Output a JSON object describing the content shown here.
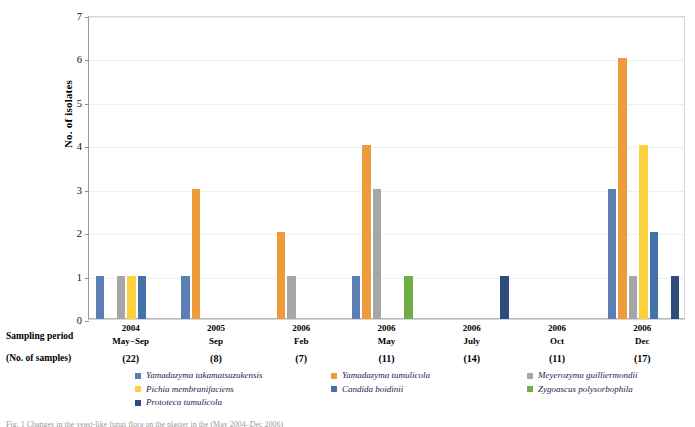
{
  "chart_data": {
    "type": "bar",
    "title": "",
    "xlabel": "Sampling period",
    "ylabel": "No. of isolates",
    "ylim": [
      0,
      7
    ],
    "yticks": [
      0,
      1,
      2,
      3,
      4,
      5,
      6,
      7
    ],
    "grid": true,
    "legend_position": "bottom",
    "categories": [
      "2004 May−Sep (22)",
      "2005 Sep (8)",
      "2006 Feb (7)",
      "2006 May (11)",
      "2006 July (14)",
      "2006 Oct (11)",
      "2006 Dec (17)"
    ],
    "series": [
      {
        "name": "Yamadazyma takamatsuzukensis",
        "color": "#5B7FB4",
        "values": [
          1,
          1,
          0,
          1,
          0,
          0,
          3
        ]
      },
      {
        "name": "Yamadazyma tumulicola",
        "color": "#ED9C3C",
        "values": [
          0,
          3,
          2,
          4,
          0,
          0,
          6
        ]
      },
      {
        "name": "Meyerozyma guilliermondii",
        "color": "#A6A6A6",
        "values": [
          1,
          0,
          1,
          3,
          0,
          0,
          1
        ]
      },
      {
        "name": "Pichia membranifaciens",
        "color": "#FCD13F",
        "values": [
          1,
          0,
          0,
          0,
          0,
          0,
          4
        ]
      },
      {
        "name": "Candida boidinii",
        "color": "#4472A8",
        "values": [
          1,
          0,
          0,
          0,
          0,
          0,
          2
        ]
      },
      {
        "name": "Zygoascus polysorbophila",
        "color": "#70AD47",
        "values": [
          0,
          0,
          0,
          1,
          0,
          0,
          0
        ]
      },
      {
        "name": "Prototeca tumulicola",
        "color": "#2E4B7A",
        "values": [
          0,
          0,
          0,
          0,
          1,
          0,
          1
        ]
      }
    ]
  },
  "axis": {
    "y_title": "No. of isolates",
    "y_tick_labels": [
      "7",
      "6",
      "5",
      "4",
      "3",
      "2",
      "1",
      "0"
    ]
  },
  "row_labels": {
    "sampling_period": "Sampling period",
    "no_of_samples": "(No. of samples)"
  },
  "groups": [
    {
      "year": "2004",
      "month": "May−Sep",
      "samples": "(22)"
    },
    {
      "year": "2005",
      "month": "Sep",
      "samples": "(8)"
    },
    {
      "year": "2006",
      "month": "Feb",
      "samples": "(7)"
    },
    {
      "year": "2006",
      "month": "May",
      "samples": "(11)"
    },
    {
      "year": "2006",
      "month": "July",
      "samples": "(14)"
    },
    {
      "year": "2006",
      "month": "Oct",
      "samples": "(11)"
    },
    {
      "year": "2006",
      "month": "Dec",
      "samples": "(17)"
    }
  ],
  "legend": {
    "items": [
      {
        "label": "Yamadazyma takamatsuzukensis",
        "color": "#5B7FB4"
      },
      {
        "label": "Yamadazyma tumulicola",
        "color": "#ED9C3C"
      },
      {
        "label": "Meyerozyma guilliermondii",
        "color": "#A6A6A6"
      },
      {
        "label": "Pichia membranifaciens",
        "color": "#FCD13F"
      },
      {
        "label": "Candida boidinii",
        "color": "#4472A8"
      },
      {
        "label": "Zygoascus polysorbophila",
        "color": "#70AD47"
      },
      {
        "label": "Prototeca tumulicola",
        "color": "#2E4B7A"
      }
    ]
  },
  "figure_caption": "Fig. 1  Changes in the yeast-like fungi flora on the plaster in the (May 2004–Dec 2006)"
}
